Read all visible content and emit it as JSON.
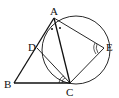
{
  "diagram": {
    "type": "geometry",
    "points": {
      "A": {
        "label": "A",
        "x": 54,
        "y": 18
      },
      "B": {
        "label": "B",
        "x": 14,
        "y": 83
      },
      "C": {
        "label": "C",
        "x": 70,
        "y": 83
      },
      "D": {
        "label": "D",
        "x": 37,
        "y": 48
      },
      "E": {
        "label": "E",
        "x": 104,
        "y": 48
      }
    },
    "circle": {
      "cx": 76,
      "cy": 50,
      "r": 34,
      "through": [
        "A",
        "D",
        "C",
        "E"
      ]
    },
    "segments": [
      "AB",
      "BC",
      "AC",
      "AE",
      "EC",
      "DC"
    ],
    "angle_marks": [
      {
        "vertex": "A",
        "type": "equal-dots",
        "note": "angle BAC bisected (two dots)"
      },
      {
        "vertex": "E",
        "type": "double-arc",
        "angle": "AEC"
      },
      {
        "vertex": "C",
        "type": "double-arc",
        "angle": "DCB"
      }
    ],
    "colors": {
      "stroke": "#111111",
      "background": "#ffffff"
    }
  }
}
